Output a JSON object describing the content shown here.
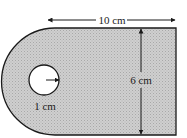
{
  "diagram": {
    "labels": {
      "width": "10 cm",
      "height": "6 cm",
      "hole_radius": "1 cm"
    },
    "colors": {
      "shape_fill": "#c8c8c8",
      "stroke": "#1a1a1a",
      "hole_fill": "#ffffff"
    }
  }
}
